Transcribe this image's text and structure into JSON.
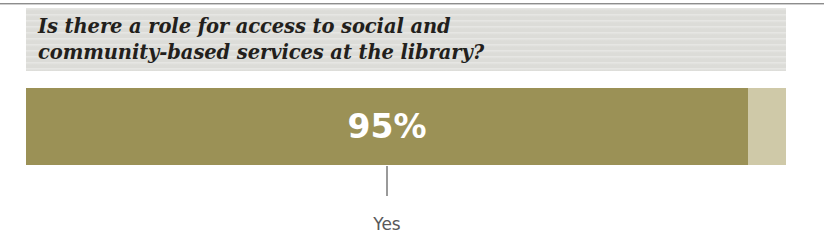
{
  "figure": {
    "question": "Is there a role for access to social and\ncommunity-based services at the library?",
    "value_label": "95%",
    "category_label": "Yes"
  },
  "chart_data": {
    "type": "bar",
    "title": "Is there a role for access to social and community-based services at the library?",
    "orientation": "horizontal",
    "categories": [
      "Yes"
    ],
    "values": [
      95
    ],
    "value_labels": [
      "95%"
    ],
    "unit": "percent",
    "xlabel": "",
    "ylabel": "",
    "xlim": [
      0,
      100
    ],
    "grid": false,
    "legend": false,
    "colors": {
      "bar_fill": "#9b9156",
      "bar_remainder": "#cfc9a8",
      "value_text": "#ffffff",
      "header_band": "#dcdcd8",
      "header_text": "#231f1c",
      "leader_line": "#9a9a9a",
      "category_text": "#58585a"
    }
  }
}
